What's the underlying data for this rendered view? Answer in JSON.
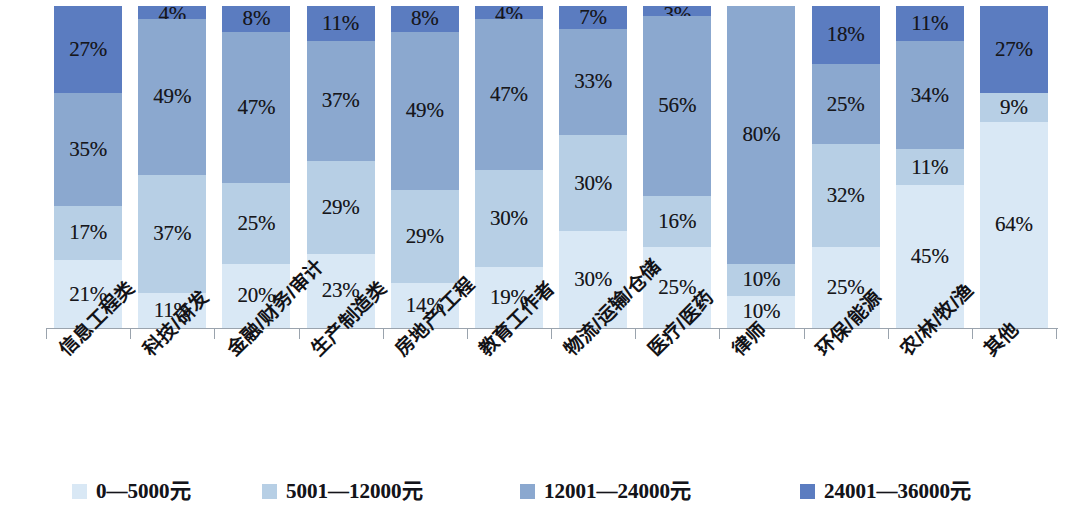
{
  "chart_data": {
    "type": "bar",
    "subtype": "100% stacked bar",
    "title": "",
    "xlabel": "",
    "ylabel": "",
    "ylim": [
      0,
      100
    ],
    "grid": false,
    "legend_position": "bottom",
    "value_format": "percent",
    "categories": [
      "信息工程类",
      "科技/研发",
      "金融/财务/审计",
      "生产制造类",
      "房地产/工程",
      "教育工作者",
      "物流/运输/仓储",
      "医疗/医药",
      "律师",
      "环保/能源",
      "农/林/牧/渔",
      "其他"
    ],
    "series": [
      {
        "name": "0—5000元",
        "color": "#d9e8f5",
        "values": [
          21,
          11,
          20,
          23,
          14,
          19,
          30,
          25,
          10,
          25,
          45,
          64
        ]
      },
      {
        "name": "5001—12000元",
        "color": "#b7cfe5",
        "values": [
          17,
          37,
          25,
          29,
          29,
          30,
          30,
          16,
          10,
          32,
          11,
          9
        ]
      },
      {
        "name": "12001—24000元",
        "color": "#8ba8cf",
        "values": [
          35,
          49,
          47,
          37,
          49,
          47,
          33,
          56,
          80,
          25,
          34,
          0
        ]
      },
      {
        "name": "24001—36000元",
        "color": "#5b7cc0",
        "values": [
          27,
          4,
          8,
          11,
          8,
          4,
          7,
          3,
          0,
          18,
          11,
          27
        ]
      }
    ],
    "labels": {
      "信息工程类": [
        "21%",
        "17%",
        "35%",
        "27%"
      ],
      "科技/研发": [
        "11%",
        "37%",
        "49%",
        "4%"
      ],
      "金融/财务/审计": [
        "20%",
        "25%",
        "47%",
        "8%"
      ],
      "生产制造类": [
        "23%",
        "29%",
        "37%",
        "11%"
      ],
      "房地产/工程": [
        "14%",
        "29%",
        "49%",
        "8%"
      ],
      "教育工作者": [
        "19%",
        "30%",
        "47%",
        "4%"
      ],
      "物流/运输/仓储": [
        "30%",
        "30%",
        "33%",
        "7%"
      ],
      "医疗/医药": [
        "25%",
        "16%",
        "56%",
        "3%"
      ],
      "律师": [
        "10%",
        "10%",
        "80%",
        ""
      ],
      "环保/能源": [
        "25%",
        "32%",
        "25%",
        "18%"
      ],
      "农/林/牧/渔": [
        "45%",
        "11%",
        "34%",
        "11%"
      ],
      "其他": [
        "64%",
        "9%",
        "",
        "27%"
      ]
    }
  },
  "legend": {
    "items": [
      {
        "label": "0—5000元",
        "color": "#d9e8f5"
      },
      {
        "label": "5001—12000元",
        "color": "#b7cfe5"
      },
      {
        "label": "12001—24000元",
        "color": "#8ba8cf"
      },
      {
        "label": "24001—36000元",
        "color": "#5b7cc0"
      }
    ]
  },
  "axis": {
    "line_color": "#9aa3ad"
  }
}
